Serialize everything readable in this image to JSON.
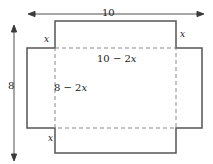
{
  "figure": {
    "type": "geometry-diagram",
    "labels": {
      "width_total": "10",
      "height_total": "8",
      "corner_top_left": "x",
      "corner_top_right": "x",
      "corner_bottom_left": "x",
      "base_width": "10 − 2x",
      "base_height": "8 − 2x"
    },
    "colors": {
      "solid_line": "#555555",
      "dashed_line": "#8a8a8a",
      "arrow_line": "#3a3a3a",
      "text": "#1a1a1a",
      "background": "#ffffff"
    }
  }
}
